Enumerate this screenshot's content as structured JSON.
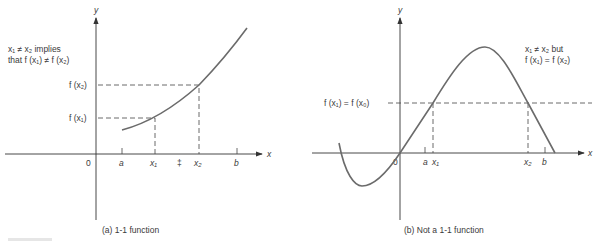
{
  "panel_a": {
    "caption": "(a)  1-1 function",
    "axis_y_label": "y",
    "axis_x_label": "x",
    "origin_label": "0",
    "note_line1": "x₁ ≠ x₂ implies",
    "note_line2": "that f (x₁) ≠ f (x₂)",
    "y_labels": {
      "fx2": "f (x₂)",
      "fx1": "f (x₁)"
    },
    "x_ticks": [
      {
        "label": "a"
      },
      {
        "label": "x₁"
      },
      {
        "label": "‡"
      },
      {
        "label": "x₂"
      },
      {
        "label": "b"
      }
    ]
  },
  "panel_b": {
    "caption": "(b)  Not a 1-1 function",
    "axis_y_label": "y",
    "axis_x_label": "x",
    "origin_label": "0",
    "note_line1": "x₁ ≠ x₂ but",
    "note_line2": "f (x₁) = f (x₂)",
    "y_label": "f (x₁) = f (x₀)",
    "x_ticks": [
      {
        "label": "a"
      },
      {
        "label": "x₁"
      },
      {
        "label": "x₂"
      },
      {
        "label": "b"
      }
    ]
  },
  "colors": {
    "curve": "#6b6b6b",
    "axis": "#333333"
  }
}
